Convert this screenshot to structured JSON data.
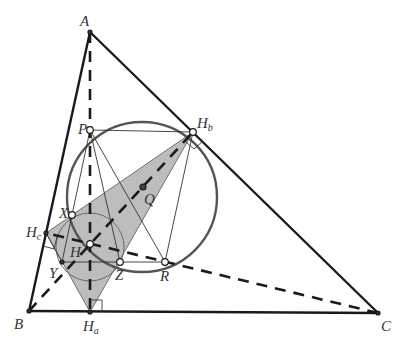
{
  "diagram": {
    "colors": {
      "stroke": "#1a1a1a",
      "circle": "#555555",
      "shade": "#bdbdbd",
      "background": "#ffffff"
    },
    "points": {
      "A": {
        "label": "A",
        "sub": "",
        "x": 90,
        "y": 32
      },
      "B": {
        "label": "B",
        "sub": "",
        "x": 29,
        "y": 311
      },
      "C": {
        "label": "C",
        "sub": "",
        "x": 378,
        "y": 313
      },
      "Ha": {
        "label": "H",
        "sub": "a",
        "x": 90,
        "y": 312
      },
      "Hb": {
        "label": "H",
        "sub": "b",
        "x": 193,
        "y": 132
      },
      "Hc": {
        "label": "H",
        "sub": "c",
        "x": 46,
        "y": 233
      },
      "H": {
        "label": "H",
        "sub": "",
        "x": 90,
        "y": 244
      },
      "P": {
        "label": "P",
        "sub": "",
        "x": 90,
        "y": 130
      },
      "Q": {
        "label": "Q",
        "sub": "",
        "x": 143,
        "y": 187
      },
      "X": {
        "label": "X",
        "sub": "",
        "x": 72,
        "y": 215
      },
      "Y": {
        "label": "Y",
        "sub": "",
        "x": 62,
        "y": 262
      },
      "Z": {
        "label": "Z",
        "sub": "",
        "x": 120,
        "y": 262
      },
      "R": {
        "label": "R",
        "sub": "",
        "x": 165,
        "y": 262
      }
    },
    "labels": {
      "A": "A",
      "B": "B",
      "C": "C",
      "H": "H",
      "P": "P",
      "Q": "Q",
      "X": "X",
      "Y": "Y",
      "Z": "Z",
      "R": "R",
      "Ha_main": "H",
      "Ha_sub": "a",
      "Hb_main": "H",
      "Hb_sub": "b",
      "Hc_main": "H",
      "Hc_sub": "c"
    },
    "circles": [
      {
        "name": "large-circle",
        "cx": 142,
        "cy": 197,
        "r": 75
      },
      {
        "name": "small-circle-H",
        "cx": 90,
        "cy": 247,
        "r": 34
      }
    ],
    "shaded_polygon": [
      "Hc",
      "Hb",
      "Ha"
    ],
    "solid_segments": [
      [
        "A",
        "B"
      ],
      [
        "A",
        "C"
      ],
      [
        "B",
        "C"
      ]
    ],
    "dashed_segments": [
      [
        "A",
        "Ha"
      ],
      [
        "B",
        "Hb"
      ],
      [
        "C",
        "Hc"
      ]
    ],
    "thin_segments": [
      [
        "P",
        "Hb"
      ],
      [
        "P",
        "X"
      ],
      [
        "P",
        "Z"
      ],
      [
        "P",
        "R"
      ],
      [
        "Hb",
        "R"
      ],
      [
        "Y",
        "R"
      ],
      [
        "X",
        "Y"
      ],
      [
        "Hc",
        "Y"
      ]
    ],
    "right_angle_marks": [
      "Ha",
      "Hb",
      "Hc"
    ]
  }
}
